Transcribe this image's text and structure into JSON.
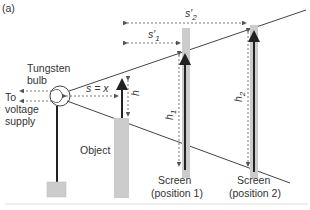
{
  "figure": {
    "panel_label": "(a)",
    "colors": {
      "line": "#444444",
      "arrow": "#222222",
      "bar": "#cccccc",
      "baseline": "#dddddd",
      "text": "#333333"
    },
    "labels": {
      "bulb_line1": "Tungsten",
      "bulb_line2": "bulb",
      "supply_line1": "To",
      "supply_line2": "voltage",
      "supply_line3": "supply",
      "object": "Object",
      "screen1_line1": "Screen",
      "screen1_line2": "(position 1)",
      "screen2_line1": "Screen",
      "screen2_line2": "(position 2)",
      "distance_s": "s = x",
      "distance_s1": "s′",
      "distance_s1_sub": "1",
      "distance_s2": "s′",
      "distance_s2_sub": "2",
      "height_h": "h",
      "height_h1": "h",
      "height_h1_sub": "1",
      "height_h2": "h",
      "height_h2_sub": "2"
    }
  }
}
